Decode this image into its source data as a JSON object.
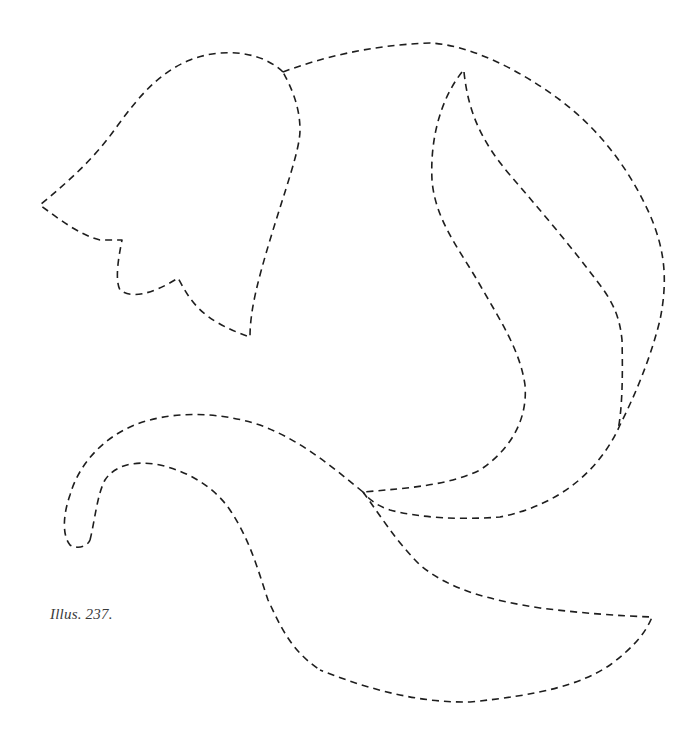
{
  "caption": {
    "text": "Illus. 237."
  },
  "illustration": {
    "style": "dashed-outline",
    "stroke_color": "#1e1e1e",
    "background": "#ffffff",
    "shapes": [
      {
        "name": "bell-flower",
        "description": "bell-shaped flower head with scalloped lower edge"
      },
      {
        "name": "upper-leaf-outer",
        "description": "large rounded leaf outline on the right"
      },
      {
        "name": "upper-leaf-inner",
        "description": "inner teardrop leaf vein"
      },
      {
        "name": "stem",
        "description": "curling stem with hooked end on the left"
      },
      {
        "name": "lower-leaf",
        "description": "pointed leaf extending to lower right"
      }
    ]
  }
}
